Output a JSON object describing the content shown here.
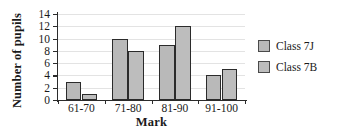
{
  "chart_data": {
    "type": "bar",
    "title": "",
    "xlabel": "Mark",
    "ylabel": "Number of pupils",
    "categories": [
      "61-70",
      "71-80",
      "81-90",
      "91-100"
    ],
    "series": [
      {
        "name": "Class 7J",
        "values": [
          3,
          10,
          9,
          4
        ],
        "color": "#b9b9b9"
      },
      {
        "name": "Class 7B",
        "values": [
          1,
          8,
          12,
          5
        ],
        "color": "#bdbdbd"
      }
    ],
    "ylim": [
      0,
      14
    ],
    "yticks": [
      0,
      2,
      4,
      6,
      8,
      10,
      12,
      14
    ],
    "ytick_labels": [
      "0",
      "2",
      "4",
      "6",
      "8",
      "10",
      "12",
      "14"
    ],
    "grid": true,
    "grid_axis": "y",
    "legend_position": "right",
    "bar_edge_color": "#2b2b2b",
    "axis_color": "#2b2b2b",
    "grid_color": "#e3e3e3",
    "background": "#ffffff"
  }
}
